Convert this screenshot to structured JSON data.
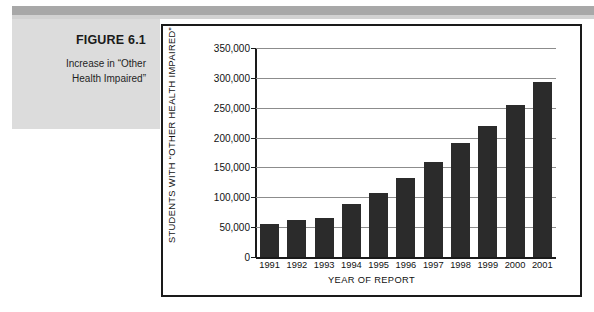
{
  "caption": {
    "figure_number": "FIGURE 6.1",
    "figure_title_line1": "Increase in “Other",
    "figure_title_line2": "Health Impaired”"
  },
  "colors": {
    "bar": "#2b2b2b",
    "caption_block": "#dcdcdc",
    "band": "#a8a8a8",
    "frame": "#1a1a1a",
    "gridline": "#8c8c8c"
  },
  "chart_data": {
    "type": "bar",
    "title": "",
    "xlabel": "YEAR OF REPORT",
    "ylabel": "STUDENTS WITH “OTHER HEALTH IMPAIRED”",
    "categories": [
      "1991",
      "1992",
      "1993",
      "1994",
      "1995",
      "1996",
      "1997",
      "1998",
      "1999",
      "2000",
      "2001"
    ],
    "values": [
      56000,
      62000,
      66000,
      88000,
      108000,
      133000,
      159000,
      191000,
      220000,
      255000,
      293000
    ],
    "ylim": [
      0,
      350000
    ],
    "ytick_values": [
      0,
      50000,
      100000,
      150000,
      200000,
      250000,
      300000,
      350000
    ],
    "ytick_labels": [
      "0",
      "50,000",
      "100,000",
      "150,000",
      "200,000",
      "250,000",
      "300,000",
      "350,000"
    ],
    "grid": true,
    "legend": false,
    "legend_position": "none"
  }
}
